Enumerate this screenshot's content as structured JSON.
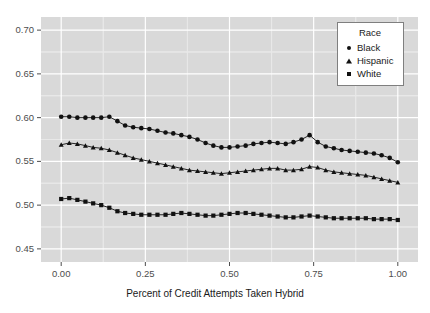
{
  "chart_data": {
    "type": "line",
    "title": "",
    "xlabel": "Percent of Credit Attempts Taken Hybrid",
    "ylabel": "",
    "xlim": [
      -0.06,
      1.06
    ],
    "ylim": [
      0.435,
      0.715
    ],
    "xticks": [
      0.0,
      0.25,
      0.5,
      0.75,
      1.0
    ],
    "xtick_labels": [
      "0.00",
      "0.25",
      "0.50",
      "0.75",
      "1.00"
    ],
    "yticks": [
      0.45,
      0.5,
      0.55,
      0.6,
      0.65,
      0.7
    ],
    "ytick_labels": [
      "0.45",
      "0.50",
      "0.55",
      "0.60",
      "0.65",
      "0.70"
    ],
    "grid": true,
    "grid_major_color": "#ffffff",
    "panel_background": "#d9d9d9",
    "legend_position": "top-right-inside",
    "legend_title": "Race",
    "marker_color": "#111111",
    "line_color": "#111111",
    "x": [
      0.0,
      0.024,
      0.048,
      0.072,
      0.095,
      0.119,
      0.143,
      0.167,
      0.19,
      0.214,
      0.238,
      0.262,
      0.286,
      0.31,
      0.333,
      0.357,
      0.381,
      0.405,
      0.429,
      0.452,
      0.476,
      0.5,
      0.524,
      0.548,
      0.571,
      0.595,
      0.619,
      0.643,
      0.667,
      0.69,
      0.714,
      0.738,
      0.762,
      0.786,
      0.81,
      0.833,
      0.857,
      0.881,
      0.905,
      0.929,
      0.952,
      0.976,
      1.0
    ],
    "series": [
      {
        "name": "Black",
        "marker": "circle",
        "values": [
          0.601,
          0.601,
          0.6,
          0.6,
          0.6,
          0.6,
          0.601,
          0.596,
          0.591,
          0.589,
          0.588,
          0.587,
          0.585,
          0.583,
          0.582,
          0.58,
          0.578,
          0.575,
          0.571,
          0.568,
          0.566,
          0.566,
          0.567,
          0.568,
          0.57,
          0.571,
          0.572,
          0.571,
          0.57,
          0.572,
          0.575,
          0.58,
          0.572,
          0.567,
          0.565,
          0.563,
          0.562,
          0.561,
          0.56,
          0.559,
          0.557,
          0.554,
          0.549
        ]
      },
      {
        "name": "Hispanic",
        "marker": "triangle",
        "values": [
          0.569,
          0.571,
          0.57,
          0.568,
          0.566,
          0.565,
          0.563,
          0.56,
          0.557,
          0.554,
          0.552,
          0.55,
          0.548,
          0.546,
          0.544,
          0.542,
          0.54,
          0.539,
          0.538,
          0.537,
          0.536,
          0.537,
          0.538,
          0.539,
          0.54,
          0.541,
          0.542,
          0.542,
          0.54,
          0.54,
          0.541,
          0.544,
          0.543,
          0.54,
          0.538,
          0.537,
          0.536,
          0.535,
          0.534,
          0.532,
          0.53,
          0.528,
          0.526
        ]
      },
      {
        "name": "White",
        "marker": "square",
        "values": [
          0.507,
          0.508,
          0.506,
          0.504,
          0.502,
          0.5,
          0.497,
          0.493,
          0.491,
          0.49,
          0.489,
          0.489,
          0.489,
          0.489,
          0.49,
          0.491,
          0.49,
          0.489,
          0.488,
          0.488,
          0.489,
          0.49,
          0.491,
          0.491,
          0.49,
          0.489,
          0.488,
          0.487,
          0.486,
          0.486,
          0.487,
          0.488,
          0.487,
          0.486,
          0.485,
          0.485,
          0.485,
          0.485,
          0.485,
          0.484,
          0.484,
          0.484,
          0.483
        ]
      }
    ]
  },
  "legend": {
    "title": "Race",
    "items": [
      {
        "label": "Black",
        "marker": "circle"
      },
      {
        "label": "Hispanic",
        "marker": "triangle"
      },
      {
        "label": "White",
        "marker": "square"
      }
    ]
  },
  "axes": {
    "x_title": "Percent of Credit Attempts Taken Hybrid"
  }
}
